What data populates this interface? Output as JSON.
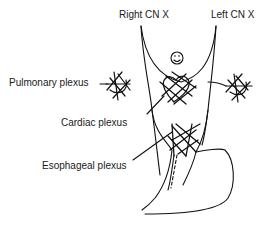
{
  "diagram": {
    "labels": {
      "right_vagus": "Right CN X",
      "left_vagus": "Left CN X",
      "pulmonary": "Pulmonary plexus",
      "cardiac": "Cardiac plexus",
      "esophageal": "Esophageal plexus"
    },
    "icons": {
      "heart_face": "smiley-face-icon"
    },
    "colors": {
      "stroke": "#111111",
      "text": "#1a1a1a",
      "background": "#ffffff"
    }
  }
}
